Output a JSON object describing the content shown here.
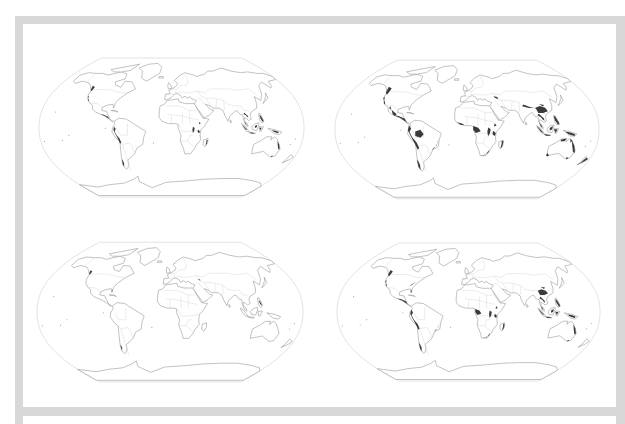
{
  "figure": {
    "frame_color": "#d8d8d8",
    "land_outline_color": "#9a9a9a",
    "highlight_color": "#3a3a3a",
    "maps": [
      {
        "id": "map-top-left",
        "highlight_level": "light",
        "highlighted_regions": [
          "western-north-america",
          "central-america",
          "andes",
          "east-africa",
          "madagascar",
          "southeast-asia",
          "philippines",
          "indonesia",
          "new-guinea",
          "eastern-australia",
          "southern-chile"
        ]
      },
      {
        "id": "map-top-right",
        "highlight_level": "heavy",
        "highlighted_regions": [
          "western-north-america",
          "mexico",
          "central-america",
          "andes",
          "amazon",
          "atlantic-brazil",
          "west-africa",
          "central-africa",
          "east-africa",
          "south-africa",
          "madagascar",
          "caucasus",
          "himalaya",
          "southern-china",
          "southeast-asia",
          "philippines",
          "indonesia",
          "new-guinea",
          "northern-australia",
          "eastern-australia",
          "southwest-australia",
          "new-zealand",
          "southern-chile"
        ]
      },
      {
        "id": "map-bottom-left",
        "highlight_level": "minimal",
        "highlighted_regions": [
          "pacific-northwest",
          "florida",
          "caucasus",
          "philippines",
          "southern-chile",
          "scandinavia"
        ]
      },
      {
        "id": "map-bottom-right",
        "highlight_level": "moderate",
        "highlighted_regions": [
          "western-north-america",
          "eastern-north-america",
          "central-america",
          "andes",
          "atlantic-brazil",
          "central-africa",
          "east-africa",
          "south-africa",
          "madagascar",
          "southern-china",
          "southeast-asia",
          "philippines",
          "indonesia",
          "new-guinea",
          "eastern-australia",
          "southern-chile"
        ]
      }
    ]
  }
}
